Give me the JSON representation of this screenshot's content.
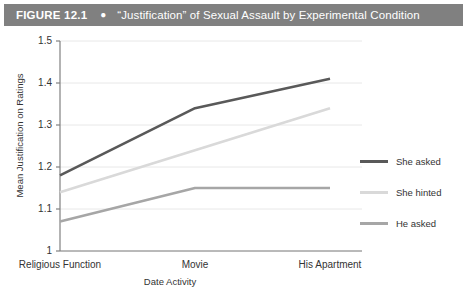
{
  "header": {
    "figure_number": "FIGURE 12.1",
    "bullet": "●",
    "title": "“Justification” of Sexual Assault by Experimental Condition"
  },
  "colors": {
    "header_bar": "#808080",
    "series_she_asked": "#595959",
    "series_she_hinted": "#d9d9d9",
    "series_he_asked": "#a6a6a6",
    "gridline": "#e8e8e8",
    "axis": "#808080",
    "text": "#333333"
  },
  "chart_data": {
    "type": "line",
    "title": "“Justification” of Sexual Assault by Experimental Condition",
    "xlabel": "Date Activity",
    "ylabel": "Mean Justification on Ratings",
    "categories": [
      "Religious Function",
      "Movie",
      "His Apartment"
    ],
    "ylim": [
      1,
      1.5
    ],
    "yticks": [
      "1",
      "1.1",
      "1.2",
      "1.3",
      "1.4",
      "1.5"
    ],
    "ytick_values": [
      1,
      1.1,
      1.2,
      1.3,
      1.4,
      1.5
    ],
    "grid": true,
    "legend_position": "right",
    "series": [
      {
        "name": "She asked",
        "values": [
          1.18,
          1.34,
          1.41
        ],
        "color": "#595959"
      },
      {
        "name": "She hinted",
        "values": [
          1.14,
          1.24,
          1.34
        ],
        "color": "#d9d9d9"
      },
      {
        "name": "He asked",
        "values": [
          1.07,
          1.15,
          1.15
        ],
        "color": "#a6a6a6"
      }
    ]
  }
}
